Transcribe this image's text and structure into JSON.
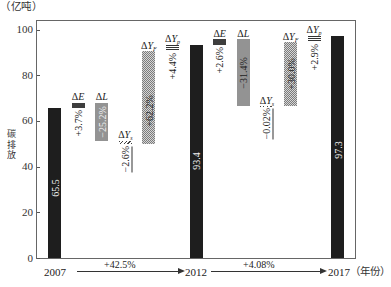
{
  "chart_data": {
    "type": "waterfall",
    "title": "",
    "yunit": "（亿吨）",
    "ylabel": "碳排放",
    "xlabel": "年份",
    "xunit": "（年份）",
    "ylim": [
      0,
      100
    ],
    "grid": false,
    "legend": null,
    "yticks": [
      "0",
      "20",
      "40",
      "60",
      "80",
      "100"
    ],
    "x": [
      "2007",
      "2012",
      "2017"
    ],
    "totals": [
      65.5,
      93.4,
      97.3
    ],
    "period_changes": [
      {
        "from": "2007",
        "to": "2012",
        "change": "+42.5%"
      },
      {
        "from": "2012",
        "to": "2017",
        "change": "+4.08%"
      }
    ],
    "delta_symbol": "Δ",
    "colors": {
      "total": "#1e1e1e",
      "E": "#3e3e3e",
      "L": "#939393"
    },
    "steps": [
      {
        "name": "2007",
        "kind": "total",
        "start": 0,
        "end": 65.5,
        "text": "65.5",
        "fill": "total"
      },
      {
        "name": "ΔE",
        "var": "E",
        "sub": "",
        "kind": "delta",
        "start": 65.5,
        "end": 67.9,
        "text": "+3.7%",
        "text_pos": "below",
        "fill": "E"
      },
      {
        "name": "ΔL",
        "var": "L",
        "sub": "",
        "kind": "delta",
        "start": 67.9,
        "end": 51.4,
        "text": "−25.2%",
        "text_pos": "inside",
        "fill": "L"
      },
      {
        "name": "ΔYs",
        "var": "Y",
        "sub": "s",
        "kind": "delta",
        "start": 51.4,
        "end": 49.7,
        "text": "−2.6%",
        "text_pos": "below",
        "fill": "Ys"
      },
      {
        "name": "ΔYF",
        "var": "Y",
        "sub": "F",
        "kind": "delta",
        "start": 49.7,
        "end": 90.4,
        "text": "+62.2%",
        "text_pos": "inside",
        "fill": "YF"
      },
      {
        "name": "ΔYp",
        "var": "Y",
        "sub": "p",
        "kind": "delta",
        "start": 90.4,
        "end": 93.3,
        "text": "+4.4%",
        "text_pos": "below",
        "fill": "Yp"
      },
      {
        "name": "2012",
        "kind": "total",
        "start": 0,
        "end": 93.4,
        "text": "93.4",
        "fill": "total"
      },
      {
        "name": "ΔE",
        "var": "E",
        "sub": "",
        "kind": "delta",
        "start": 93.4,
        "end": 95.8,
        "text": "+2.6%",
        "text_pos": "below",
        "fill": "E"
      },
      {
        "name": "ΔL",
        "var": "L",
        "sub": "",
        "kind": "delta",
        "start": 95.8,
        "end": 66.5,
        "text": "−31.4%",
        "text_pos": "inside",
        "fill": "L"
      },
      {
        "name": "ΔYs",
        "var": "Y",
        "sub": "s",
        "kind": "delta",
        "start": 66.5,
        "end": 66.5,
        "text": "−0.02%",
        "text_pos": "below",
        "fill": "Ys"
      },
      {
        "name": "ΔYF",
        "var": "Y",
        "sub": "F",
        "kind": "delta",
        "start": 66.5,
        "end": 94.5,
        "text": "+30.0%",
        "text_pos": "inside",
        "fill": "YF"
      },
      {
        "name": "ΔYp",
        "var": "Y",
        "sub": "p",
        "kind": "delta",
        "start": 94.5,
        "end": 97.2,
        "text": "+2.9%",
        "text_pos": "below",
        "fill": "Yp"
      },
      {
        "name": "2017",
        "kind": "total",
        "start": 0,
        "end": 97.3,
        "text": "97.3",
        "fill": "total"
      }
    ]
  }
}
